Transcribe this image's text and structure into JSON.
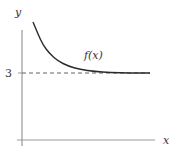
{
  "chart_data": {
    "type": "line",
    "title": "",
    "xlabel": "x",
    "ylabel": "y",
    "series": [
      {
        "name": "f(x)",
        "description": "decreasing curve approaching horizontal asymptote y = 3 from above",
        "points_px": [
          [
            33,
            22
          ],
          [
            38,
            34
          ],
          [
            43,
            45
          ],
          [
            50,
            54
          ],
          [
            58,
            61
          ],
          [
            68,
            66
          ],
          [
            80,
            69.5
          ],
          [
            95,
            71.5
          ],
          [
            110,
            72.5
          ],
          [
            130,
            73
          ],
          [
            150,
            73
          ]
        ]
      }
    ],
    "asymptote": {
      "y": 3,
      "style": "dashed",
      "label": "3"
    },
    "yticks": [
      "3"
    ],
    "xticks": [],
    "grid": false,
    "legend": false,
    "annotations": [
      {
        "text": "f(x)",
        "position": "above curve near asymptote"
      }
    ]
  },
  "labels": {
    "y_axis": "y",
    "x_axis": "x",
    "y_tick": "3",
    "curve": "f(x)"
  },
  "colors": {
    "axis": "#999999",
    "curve": "#2a2a2a",
    "dashed": "#555555",
    "text": "#333333"
  }
}
